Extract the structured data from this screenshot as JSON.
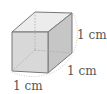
{
  "diagram": {
    "shape": "cube",
    "labels": {
      "height": "1 cm",
      "depth": "1 cm",
      "width": "1 cm"
    },
    "colors": {
      "front_face": "#d6d6d6",
      "top_face": "#ececec",
      "right_face": "#c4c4c4",
      "edge": "#777777",
      "hidden_edge": "#aaaaaa",
      "text": "#555555"
    }
  }
}
